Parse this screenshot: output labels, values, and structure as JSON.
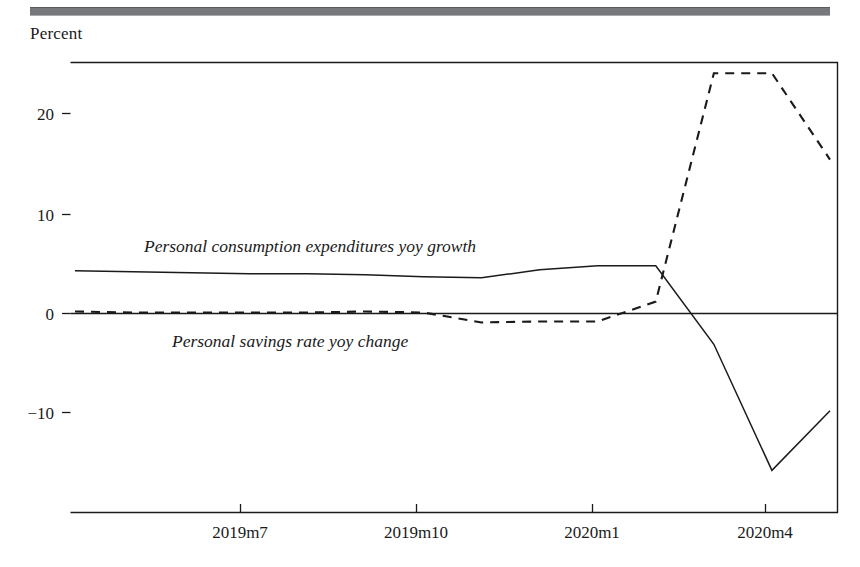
{
  "figure": {
    "axis_title": "Percent",
    "header_rule_color": "#77787c",
    "ink_color": "#1a1a1a"
  },
  "chart_data": {
    "type": "line",
    "title": "",
    "subtitle": "",
    "xlabel": "",
    "ylabel": "Percent",
    "ylim": [
      -20,
      25
    ],
    "xlim": [
      "2019m5",
      "2020m6"
    ],
    "grid": false,
    "legend_position": "inline-annotation",
    "yticks": [
      20,
      10,
      0,
      -10
    ],
    "ytick_labels": [
      "20",
      "10",
      "0",
      "−10"
    ],
    "xticks": [
      "2019m7",
      "2019m10",
      "2020m1",
      "2020m4"
    ],
    "xtick_labels": [
      "2019m7",
      "2019m10",
      "2020m1",
      "2020m4"
    ],
    "zero_line": true,
    "x": [
      "2019m5",
      "2019m6",
      "2019m7",
      "2019m8",
      "2019m9",
      "2019m10",
      "2019m11",
      "2019m12",
      "2020m1",
      "2020m2",
      "2020m3",
      "2020m4",
      "2020m5",
      "2020m6"
    ],
    "series": [
      {
        "name": "Personal consumption expenditures yoy growth",
        "style": "solid",
        "color": "#1a1a1a",
        "annotation": "Personal consumption expenditures yoy growth",
        "values": [
          4.3,
          4.2,
          4.1,
          4.0,
          4.0,
          3.9,
          3.7,
          3.6,
          4.4,
          4.8,
          4.8,
          -3.1,
          -15.8,
          -9.8
        ]
      },
      {
        "name": "Personal savings rate yoy change",
        "style": "dashed",
        "color": "#1a1a1a",
        "annotation": "Personal savings rate yoy change",
        "values": [
          0.2,
          0.1,
          0.1,
          0.1,
          0.1,
          0.2,
          0.1,
          -0.9,
          -0.8,
          -0.8,
          1.2,
          24.2,
          24.2,
          15.5
        ]
      }
    ],
    "annotations": [
      {
        "text": "Personal consumption expenditures yoy growth",
        "x_px": 144,
        "y_px": 252
      },
      {
        "text": "Personal savings rate yoy change",
        "x_px": 172,
        "y_px": 347
      }
    ]
  }
}
